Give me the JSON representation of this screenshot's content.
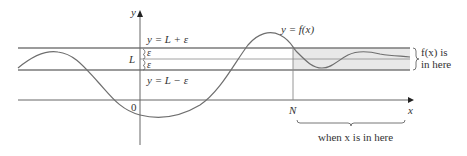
{
  "diagram": {
    "type": "limit-at-infinity-illustration",
    "axes": {
      "x_label": "x",
      "y_label": "y",
      "origin_label": "0"
    },
    "horizontal_lines": {
      "upper_label": "y = L + ε",
      "middle_label": "L",
      "lower_label": "y = L − ε",
      "epsilon_upper": "ε",
      "epsilon_lower": "ε"
    },
    "curve_label": "y = f(x)",
    "n_label": "N",
    "right_brace_label_line1": "f(x) is",
    "right_brace_label_line2": "in here",
    "bottom_brace_label": "when x is in here",
    "colors": {
      "line": "#7a7a7a",
      "axis": "#555555",
      "curve": "#6e6e6e",
      "band_fill": "#e6e6e6",
      "text": "#333333"
    }
  }
}
